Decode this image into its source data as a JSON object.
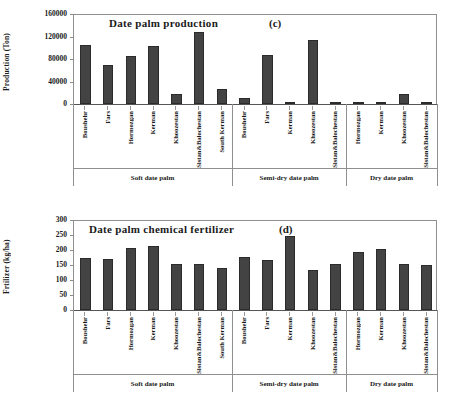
{
  "figure": {
    "background": "#ffffff",
    "bar_color": "#434343",
    "axis_color": "#8f8f8f"
  },
  "chart_data": [
    {
      "type": "bar",
      "panel": "(c)",
      "title": "Date palm  production",
      "ylabel": "Production (Ton)",
      "xlabel": "",
      "ylim": [
        0,
        160000
      ],
      "yticks": [
        0,
        40000,
        80000,
        120000,
        160000
      ],
      "grid": false,
      "legend": "none",
      "groups": [
        {
          "name": "Soft date palm",
          "categories": [
            "Boushehr",
            "Fars",
            "Hormozgan",
            "Kerman",
            "Khoozestan",
            "Sistan&Balochestan",
            "South Kerman"
          ],
          "values": [
            105000,
            68500,
            85000,
            103000,
            18500,
            128500,
            27500
          ]
        },
        {
          "name": "Semi-dry date palm",
          "categories": [
            "Boushehr",
            "Fars",
            "Kerman",
            "Khoozestan",
            "Sistan&Balochestan"
          ],
          "values": [
            10500,
            86500,
            900,
            113000,
            3200
          ]
        },
        {
          "name": "Dry date palm",
          "categories": [
            "Hormozgan",
            "Kerman",
            "Khoozestan",
            "Sistan&Balochestan"
          ],
          "values": [
            4200,
            900,
            17500,
            1200
          ]
        }
      ]
    },
    {
      "type": "bar",
      "panel": "(d)",
      "title": "Date palm  chemical fertilizer",
      "ylabel": "Frtilizer (kg/ha)",
      "xlabel": "",
      "ylim": [
        0,
        300
      ],
      "yticks": [
        0,
        50,
        100,
        150,
        200,
        250,
        300
      ],
      "grid": false,
      "legend": "none",
      "groups": [
        {
          "name": "Soft date palm",
          "categories": [
            "Boushehr",
            "Fars",
            "Hormozgan",
            "Kerman",
            "Khoozestan",
            "Sistan&Balochestan",
            "South Kerman"
          ],
          "values": [
            172,
            171,
            206,
            212,
            154,
            155,
            141
          ]
        },
        {
          "name": "Semi-dry date palm",
          "categories": [
            "Boushehr",
            "Fars",
            "Kerman",
            "Khoozestan",
            "Sistan&Balochestan"
          ],
          "values": [
            177,
            168,
            246,
            135,
            154
          ]
        },
        {
          "name": "Dry date palm",
          "categories": [
            "Hormozgan",
            "Kerman",
            "Khoozestan",
            "Sistan&Balochestan"
          ],
          "values": [
            193,
            204,
            153,
            151
          ]
        }
      ]
    }
  ]
}
